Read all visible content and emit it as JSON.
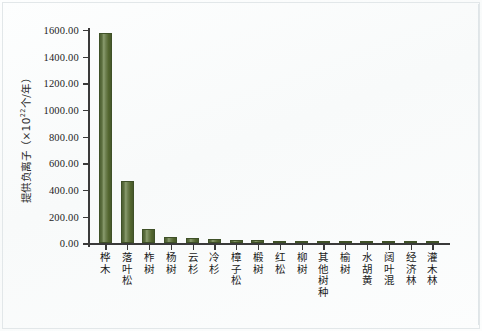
{
  "chart_data": {
    "type": "bar",
    "title": "",
    "xlabel": "",
    "ylabel": "提供负离子（×10²²个/年）",
    "ylabel_base": "提供负离子（×10",
    "ylabel_sup": "22",
    "ylabel_tail": "个/年）",
    "ylim": [
      0,
      1600
    ],
    "ytick_values": [
      0,
      200,
      400,
      600,
      800,
      1000,
      1200,
      1400,
      1600
    ],
    "ytick_labels": [
      "0.00",
      "200.00",
      "400.00",
      "600.00",
      "800.00",
      "1000.00",
      "1200.00",
      "1400.00",
      "1600.00"
    ],
    "grid": false,
    "legend": false,
    "bar_color": "#5a6e3a",
    "bar_edge_color": "#3f5128",
    "axis_color": "#3a3a3a",
    "background_color": "#fbfcfc",
    "categories": [
      "桦木",
      "落叶松",
      "柞树",
      "杨树",
      "云杉",
      "冷杉",
      "樟子松",
      "椴树",
      "红松",
      "柳树",
      "其他树种",
      "榆树",
      "水胡黄",
      "阔叶混",
      "经济林",
      "灌木林"
    ],
    "values": [
      1580,
      470,
      105,
      48,
      38,
      32,
      28,
      24,
      20,
      18,
      16,
      15,
      14,
      13,
      12,
      11
    ]
  }
}
